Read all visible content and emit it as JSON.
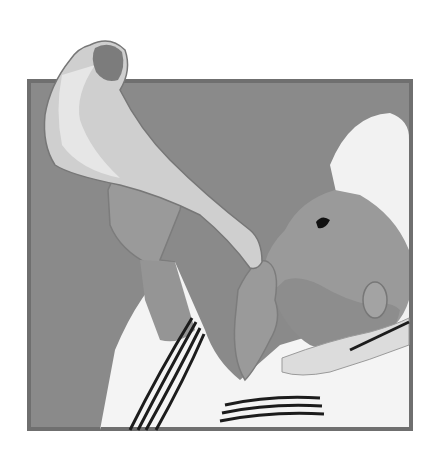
{
  "image": {
    "alt": "Illustration of a man in a prayer shawl blowing a shofar (ram's horn) against a gray square background",
    "subject": "shofar blowing",
    "colors": {
      "background": "#ffffff",
      "frame_border": "#6f6f6f",
      "frame_fill": "#8a8a8a",
      "horn_light": "#d9d9d9",
      "horn_mid": "#bdbdbd",
      "horn_dark": "#7c7c7c",
      "skin": "#9a9a9a",
      "skin_shadow": "#858585",
      "cloth": "#f4f4f4",
      "stripe": "#1c1c1c"
    }
  }
}
